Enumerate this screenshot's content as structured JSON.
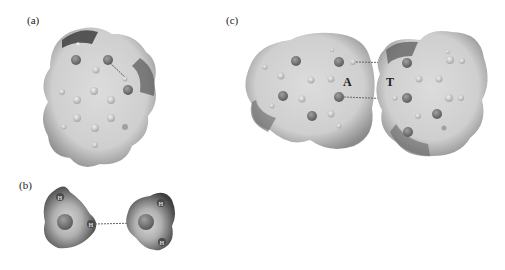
{
  "figure": {
    "panels": [
      {
        "id": "a",
        "label": "(a)",
        "description": "Electrostatic potential surface of a single nucleobase with intramolecular hydrogen bond"
      },
      {
        "id": "b",
        "label": "(b)",
        "description": "Water dimer electrostatic potential surfaces with hydrogen bond",
        "atom_labels": [
          "H",
          "H",
          "H",
          "H"
        ]
      },
      {
        "id": "c",
        "label": "(c)",
        "description": "Adenine-Thymine base pair electrostatic potential surfaces",
        "base_labels": [
          "A",
          "T"
        ]
      }
    ]
  },
  "colors": {
    "surface_light": "#d0d0d0",
    "surface_mid": "#a8a8a8",
    "surface_dark": "#555555",
    "atom_dark": "#7a7a7a",
    "atom_light": "#c4c4c4",
    "bond_dash": "#666666"
  }
}
